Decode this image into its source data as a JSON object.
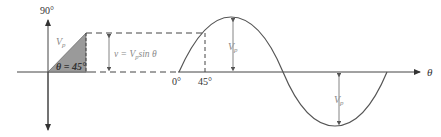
{
  "diagram": {
    "labels": {
      "vertical_axis_top": "90°",
      "phasor": "V",
      "phasor_sub": "p",
      "angle": "θ = 45°",
      "instantaneous_eq_prefix": "v = V",
      "instantaneous_eq_sub": "p",
      "instantaneous_eq_suffix": "sin θ",
      "zero_deg": "0°",
      "forty_five_deg": "45°",
      "peak_label": "V",
      "peak_label_sub": "p",
      "trough_label": "V",
      "trough_label_sub": "p",
      "horizontal_axis": "θ"
    },
    "colors": {
      "triangle_fill": "#9a9a9a",
      "lines": "#444444",
      "label_grey": "#8a8a8a"
    }
  }
}
